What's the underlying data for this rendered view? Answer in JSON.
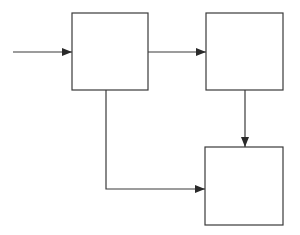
{
  "diagram": {
    "type": "block-diagram",
    "stroke_color": "#3a3a3a",
    "background": "#ffffff",
    "nodes": [
      {
        "id": "A",
        "label": "",
        "x": 72,
        "y": 13,
        "w": 76,
        "h": 77
      },
      {
        "id": "B",
        "label": "",
        "x": 206,
        "y": 13,
        "w": 77,
        "h": 77
      },
      {
        "id": "C",
        "label": "",
        "x": 205,
        "y": 147,
        "w": 78,
        "h": 78
      }
    ],
    "edges": [
      {
        "id": "input-to-A",
        "from": "external-input",
        "to": "A"
      },
      {
        "id": "A-to-B",
        "from": "A",
        "to": "B"
      },
      {
        "id": "B-to-C",
        "from": "B",
        "to": "C"
      },
      {
        "id": "A-to-C",
        "from": "A",
        "to": "C"
      }
    ]
  }
}
